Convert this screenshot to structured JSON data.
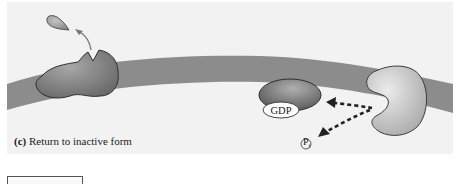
{
  "figure": {
    "panel_label": "(c)",
    "caption": "Return to inactive form",
    "labels": {
      "gdp": "GDP",
      "pi": "P",
      "pi_subscript": "i"
    },
    "elements": [
      {
        "name": "membrane",
        "description": "curved lipid membrane band"
      },
      {
        "name": "receptor",
        "description": "membrane receptor with empty binding site"
      },
      {
        "name": "ligand",
        "description": "released ligand drifting away (arrow)"
      },
      {
        "name": "g-protein-alpha-gdp",
        "description": "G-protein alpha subunit bound to GDP"
      },
      {
        "name": "effector-enzyme",
        "description": "kidney-shaped effector enzyme in membrane"
      },
      {
        "name": "dashed-arrows",
        "description": "alpha subunit returns; phosphate released"
      }
    ],
    "colors": {
      "background": "#f2f2f2",
      "membrane": "#8a8a8a",
      "receptor": "#7a7a7a",
      "alpha_subunit": "#6e6e6e",
      "effector": "#c8c8c8",
      "outline": "#333333"
    }
  }
}
